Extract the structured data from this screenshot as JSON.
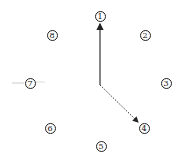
{
  "diagram": {
    "nodes": [
      {
        "id": "1",
        "label": "1",
        "x": 100,
        "y": 16
      },
      {
        "id": "2",
        "label": "2",
        "x": 145,
        "y": 35
      },
      {
        "id": "3",
        "label": "3",
        "x": 166,
        "y": 83
      },
      {
        "id": "4",
        "label": "4",
        "x": 144,
        "y": 128
      },
      {
        "id": "5",
        "label": "5",
        "x": 101,
        "y": 146
      },
      {
        "id": "6",
        "label": "6",
        "x": 50,
        "y": 128
      },
      {
        "id": "7",
        "label": "7",
        "x": 30,
        "y": 83
      },
      {
        "id": "8",
        "label": "8",
        "x": 52,
        "y": 35
      }
    ],
    "origin": {
      "x": 100,
      "y": 85
    },
    "arrows": [
      {
        "from": "origin",
        "to": "1",
        "style": "solid"
      },
      {
        "from": "origin",
        "to": "4",
        "style": "dotted"
      }
    ]
  }
}
